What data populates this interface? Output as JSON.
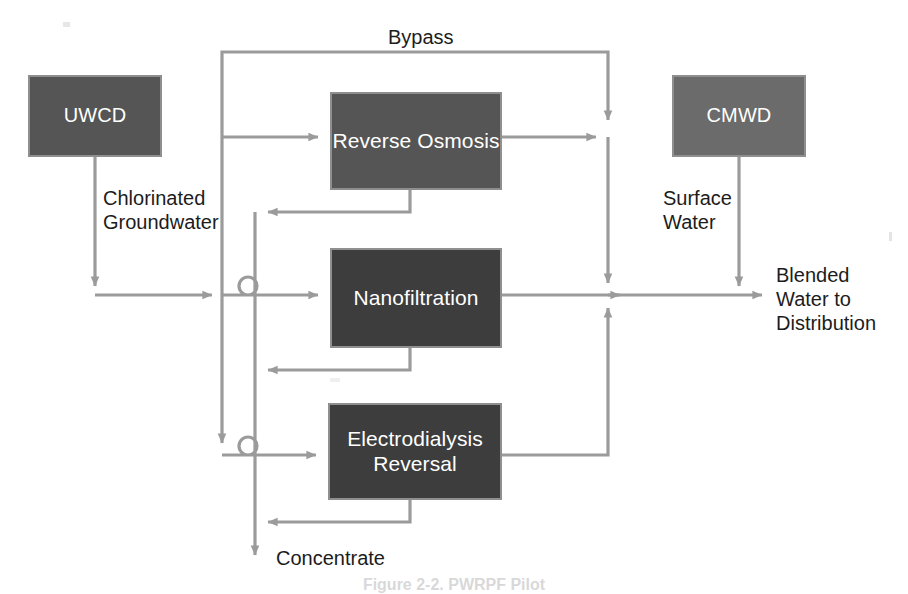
{
  "figure": {
    "type": "process-flow-diagram",
    "caption": "Figure 2-2.  PWRPF Pilot"
  },
  "colors": {
    "box_dark": "#3d3d3d",
    "box_mid": "#555555",
    "box_light": "#6b6b6b",
    "box_border": "#8f8f8f",
    "wire": "#9b9b9b",
    "text": "#1c1c1c",
    "box_text": "#ffffff",
    "background": "#ffffff"
  },
  "nodes": {
    "uwcd": {
      "label": "UWCD",
      "x": 28,
      "y": 75,
      "w": 134,
      "h": 82,
      "fill": "box-mid"
    },
    "cmwd": {
      "label": "CMWD",
      "x": 672,
      "y": 75,
      "w": 134,
      "h": 82,
      "fill": "box-light"
    },
    "reverse_osmosis": {
      "label": "Reverse\nOsmosis",
      "x": 330,
      "y": 92,
      "w": 172,
      "h": 98,
      "fill": "box-mid"
    },
    "nanofiltration": {
      "label": "Nanofiltration",
      "x": 330,
      "y": 248,
      "w": 172,
      "h": 100,
      "fill": "box-dark"
    },
    "electrodialysis_reversal": {
      "label": "Electrodialysis\nReversal",
      "x": 328,
      "y": 403,
      "w": 174,
      "h": 97,
      "fill": "box-dark"
    }
  },
  "flow_labels": {
    "bypass": "Bypass",
    "chlorinated_groundwater": "Chlorinated\nGroundwater",
    "surface_water": "Surface\nWater",
    "blended_water": "Blended\nWater to\nDistribution",
    "concentrate": "Concentrate"
  },
  "edges": [
    {
      "name": "uwcd-to-feed",
      "from": "uwcd",
      "to": "feed-header",
      "label": "Chlorinated Groundwater"
    },
    {
      "name": "feed-to-bypass",
      "from": "feed-header",
      "to": "bypass-line",
      "label": "Bypass"
    },
    {
      "name": "feed-to-reverse-osmosis",
      "from": "feed-header",
      "to": "reverse_osmosis",
      "label": ""
    },
    {
      "name": "feed-to-nanofiltration",
      "from": "feed-header",
      "to": "nanofiltration",
      "label": ""
    },
    {
      "name": "feed-to-electrodialysis-reversal",
      "from": "feed-header",
      "to": "electrodialysis_reversal",
      "label": ""
    },
    {
      "name": "reverse-osmosis-permeate",
      "from": "reverse_osmosis",
      "to": "blend-header",
      "label": ""
    },
    {
      "name": "nanofiltration-permeate",
      "from": "nanofiltration",
      "to": "blend-header",
      "label": ""
    },
    {
      "name": "electrodialysis-reversal-product",
      "from": "electrodialysis_reversal",
      "to": "blend-header",
      "label": ""
    },
    {
      "name": "reverse-osmosis-concentrate",
      "from": "reverse_osmosis",
      "to": "concentrate-header",
      "label": "Concentrate"
    },
    {
      "name": "nanofiltration-concentrate",
      "from": "nanofiltration",
      "to": "concentrate-header",
      "label": "Concentrate"
    },
    {
      "name": "electrodialysis-reversal-concentrate",
      "from": "electrodialysis_reversal",
      "to": "concentrate-header",
      "label": "Concentrate"
    },
    {
      "name": "cmwd-to-blend",
      "from": "cmwd",
      "to": "blend-header",
      "label": "Surface Water"
    },
    {
      "name": "blend-to-distribution",
      "from": "blend-header",
      "to": "distribution",
      "label": "Blended Water to Distribution"
    }
  ]
}
